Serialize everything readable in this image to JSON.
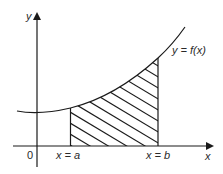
{
  "diagram": {
    "type": "definite-integral-area",
    "axes": {
      "x_label": "x",
      "y_label": "y",
      "origin_label": "0"
    },
    "curve": {
      "label": "y = f(x)",
      "shape": "increasing convex curve, minimum near y-axis"
    },
    "bounds": {
      "lower_label": "x = a",
      "upper_label": "x = b"
    },
    "region": {
      "fill": "diagonal hatching",
      "description": "shaded region bounded by curve, x-axis, x = a and x = b"
    },
    "colors": {
      "stroke": "#1a1a1a",
      "text": "#2a2a2a",
      "background": "#ffffff"
    }
  }
}
